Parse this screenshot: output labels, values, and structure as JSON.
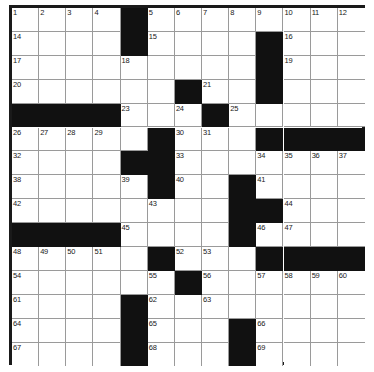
{
  "puzzle": {
    "title": "Crossword Grid",
    "columns": 13,
    "rows": 15,
    "cell_width": 27.15,
    "cell_height": 23.9,
    "colors": {
      "block": "#111111",
      "cell": "#ffffff",
      "gridline": "#9a9a9a",
      "border": "#1a1a1a",
      "number": "#202020"
    },
    "grid": [
      [
        "1",
        "2",
        "3",
        "4",
        "#",
        "5",
        "6",
        "7",
        "8",
        "9",
        "#",
        "10",
        "11",
        "12",
        "13"
      ],
      [
        "14",
        "",
        "",
        "",
        "#",
        "15",
        "",
        "",
        "",
        "",
        "#",
        "16",
        "",
        "",
        ""
      ],
      [
        "17",
        "",
        "",
        "",
        "18",
        "",
        "",
        "",
        "",
        "",
        "#",
        "19",
        "",
        "",
        ""
      ],
      [
        "20",
        "",
        "",
        "",
        "",
        "",
        "#",
        "21",
        "",
        "",
        "22",
        "",
        "",
        "",
        ""
      ],
      [
        "#",
        "#",
        "#",
        "#",
        "23",
        "",
        "",
        "#",
        "24",
        "",
        "25",
        "",
        "",
        "",
        ""
      ]
    ],
    "layout_note": "13 columns x 15 rows standard crossword. Black squares and numbering read directly from the image.",
    "black_squares": [
      [
        0,
        4
      ],
      [
        1,
        4
      ],
      [
        1,
        9
      ],
      [
        2,
        9
      ],
      [
        3,
        6
      ],
      [
        3,
        9
      ],
      [
        4,
        0
      ],
      [
        4,
        1
      ],
      [
        4,
        2
      ],
      [
        4,
        3
      ],
      [
        4,
        7
      ],
      [
        5,
        5
      ],
      [
        5,
        9
      ],
      [
        5,
        10
      ],
      [
        5,
        11
      ],
      [
        5,
        12
      ],
      [
        6,
        4
      ],
      [
        6,
        5
      ],
      [
        7,
        5
      ],
      [
        7,
        8
      ],
      [
        8,
        8
      ],
      [
        8,
        9
      ],
      [
        9,
        0
      ],
      [
        9,
        1
      ],
      [
        9,
        2
      ],
      [
        9,
        3
      ],
      [
        9,
        8
      ],
      [
        10,
        5
      ],
      [
        10,
        9
      ],
      [
        10,
        10
      ],
      [
        10,
        11
      ],
      [
        10,
        12
      ],
      [
        11,
        6
      ],
      [
        12,
        4
      ],
      [
        13,
        4
      ],
      [
        13,
        8
      ],
      [
        14,
        4
      ],
      [
        14,
        8
      ]
    ],
    "numbers": [
      {
        "r": 0,
        "c": 0,
        "n": "1"
      },
      {
        "r": 0,
        "c": 1,
        "n": "2"
      },
      {
        "r": 0,
        "c": 2,
        "n": "3"
      },
      {
        "r": 0,
        "c": 3,
        "n": "4"
      },
      {
        "r": 0,
        "c": 5,
        "n": "5"
      },
      {
        "r": 0,
        "c": 6,
        "n": "6"
      },
      {
        "r": 0,
        "c": 7,
        "n": "7"
      },
      {
        "r": 0,
        "c": 8,
        "n": "8"
      },
      {
        "r": 0,
        "c": 9,
        "n": "9"
      },
      {
        "r": 0,
        "c": 10,
        "n": "10"
      },
      {
        "r": 0,
        "c": 11,
        "n": "11"
      },
      {
        "r": 0,
        "c": 12,
        "n": "12"
      },
      {
        "r": 0,
        "c": 13,
        "n": "13"
      },
      {
        "r": 1,
        "c": 0,
        "n": "14"
      },
      {
        "r": 1,
        "c": 5,
        "n": "15"
      },
      {
        "r": 1,
        "c": 10,
        "n": "16"
      },
      {
        "r": 2,
        "c": 0,
        "n": "17"
      },
      {
        "r": 2,
        "c": 4,
        "n": "18"
      },
      {
        "r": 2,
        "c": 10,
        "n": "19"
      },
      {
        "r": 3,
        "c": 0,
        "n": "20"
      },
      {
        "r": 3,
        "c": 7,
        "n": "21"
      },
      {
        "r": 3,
        "c": 9,
        "n": "22"
      },
      {
        "r": 4,
        "c": 4,
        "n": "23"
      },
      {
        "r": 4,
        "c": 6,
        "n": "24"
      },
      {
        "r": 4,
        "c": 8,
        "n": "25"
      },
      {
        "r": 5,
        "c": 0,
        "n": "26"
      },
      {
        "r": 5,
        "c": 1,
        "n": "27"
      },
      {
        "r": 5,
        "c": 2,
        "n": "28"
      },
      {
        "r": 5,
        "c": 3,
        "n": "29"
      },
      {
        "r": 5,
        "c": 6,
        "n": "30"
      },
      {
        "r": 5,
        "c": 7,
        "n": "31"
      },
      {
        "r": 6,
        "c": 0,
        "n": "32"
      },
      {
        "r": 6,
        "c": 6,
        "n": "33"
      },
      {
        "r": 6,
        "c": 9,
        "n": "34"
      },
      {
        "r": 6,
        "c": 10,
        "n": "35"
      },
      {
        "r": 6,
        "c": 11,
        "n": "36"
      },
      {
        "r": 6,
        "c": 12,
        "n": "37"
      },
      {
        "r": 7,
        "c": 0,
        "n": "38"
      },
      {
        "r": 7,
        "c": 4,
        "n": "39"
      },
      {
        "r": 7,
        "c": 6,
        "n": "40"
      },
      {
        "r": 7,
        "c": 9,
        "n": "41"
      },
      {
        "r": 8,
        "c": 0,
        "n": "42"
      },
      {
        "r": 8,
        "c": 5,
        "n": "43"
      },
      {
        "r": 8,
        "c": 10,
        "n": "44"
      },
      {
        "r": 9,
        "c": 4,
        "n": "45"
      },
      {
        "r": 9,
        "c": 9,
        "n": "46"
      },
      {
        "r": 9,
        "c": 10,
        "n": "47"
      },
      {
        "r": 10,
        "c": 0,
        "n": "48"
      },
      {
        "r": 10,
        "c": 1,
        "n": "49"
      },
      {
        "r": 10,
        "c": 2,
        "n": "50"
      },
      {
        "r": 10,
        "c": 3,
        "n": "51"
      },
      {
        "r": 10,
        "c": 6,
        "n": "52"
      },
      {
        "r": 10,
        "c": 7,
        "n": "53"
      },
      {
        "r": 11,
        "c": 0,
        "n": "54"
      },
      {
        "r": 11,
        "c": 5,
        "n": "55"
      },
      {
        "r": 11,
        "c": 7,
        "n": "56"
      },
      {
        "r": 11,
        "c": 9,
        "n": "57"
      },
      {
        "r": 11,
        "c": 10,
        "n": "58"
      },
      {
        "r": 11,
        "c": 11,
        "n": "59"
      },
      {
        "r": 11,
        "c": 12,
        "n": "60"
      },
      {
        "r": 12,
        "c": 0,
        "n": "61"
      },
      {
        "r": 12,
        "c": 5,
        "n": "62"
      },
      {
        "r": 12,
        "c": 7,
        "n": "63"
      },
      {
        "r": 13,
        "c": 0,
        "n": "64"
      },
      {
        "r": 13,
        "c": 5,
        "n": "65"
      },
      {
        "r": 13,
        "c": 9,
        "n": "66"
      },
      {
        "r": 14,
        "c": 0,
        "n": "67"
      },
      {
        "r": 14,
        "c": 5,
        "n": "68"
      },
      {
        "r": 14,
        "c": 9,
        "n": "69"
      }
    ],
    "letters": []
  }
}
